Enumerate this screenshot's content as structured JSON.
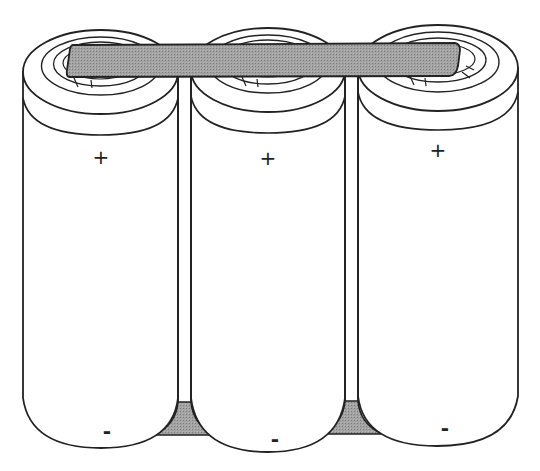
{
  "figure": {
    "cell_count": 3,
    "colors": {
      "outline": "#222222",
      "strap_fill": "#9a9a9a",
      "wedge_fill": "#9a9a9a",
      "cell_fill": "#ffffff"
    },
    "cells": [
      {
        "id": "cell-1",
        "top_label": "+",
        "bottom_label": "-"
      },
      {
        "id": "cell-2",
        "top_label": "+",
        "bottom_label": "-"
      },
      {
        "id": "cell-3",
        "top_label": "+",
        "bottom_label": "-"
      }
    ],
    "connector": {
      "name": "nickel strap",
      "spans_cells": 3
    }
  }
}
